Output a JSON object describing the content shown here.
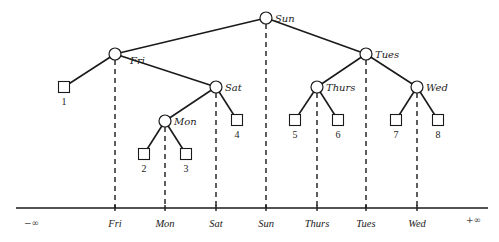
{
  "diagram": {
    "type": "binary-search-tree-with-axis",
    "nodes": [
      {
        "id": "sun",
        "label": "Sun",
        "x": 266,
        "y": 18
      },
      {
        "id": "fri",
        "label": "Fri",
        "x": 115,
        "y": 54
      },
      {
        "id": "tues",
        "label": "Tues",
        "x": 366,
        "y": 54
      },
      {
        "id": "sat",
        "label": "Sat",
        "x": 216,
        "y": 87
      },
      {
        "id": "thurs",
        "label": "Thurs",
        "x": 317,
        "y": 87
      },
      {
        "id": "wed",
        "label": "Wed",
        "x": 417,
        "y": 87
      },
      {
        "id": "mon",
        "label": "Mon",
        "x": 165,
        "y": 121
      }
    ],
    "leaves": [
      {
        "id": "leaf1",
        "label": "1",
        "parent": "fri",
        "x": 64,
        "y": 87
      },
      {
        "id": "leaf2",
        "label": "2",
        "parent": "mon",
        "x": 144,
        "y": 154
      },
      {
        "id": "leaf3",
        "label": "3",
        "parent": "mon",
        "x": 186,
        "y": 154
      },
      {
        "id": "leaf4",
        "label": "4",
        "parent": "sat",
        "x": 237,
        "y": 120
      },
      {
        "id": "leaf5",
        "label": "5",
        "parent": "thurs",
        "x": 295,
        "y": 120
      },
      {
        "id": "leaf6",
        "label": "6",
        "parent": "thurs",
        "x": 338,
        "y": 120
      },
      {
        "id": "leaf7",
        "label": "7",
        "parent": "wed",
        "x": 396,
        "y": 120
      },
      {
        "id": "leaf8",
        "label": "8",
        "parent": "wed",
        "x": 438,
        "y": 120
      }
    ],
    "edges": [
      [
        "sun",
        "fri"
      ],
      [
        "sun",
        "tues"
      ],
      [
        "fri",
        "leaf1"
      ],
      [
        "fri",
        "sat"
      ],
      [
        "sat",
        "mon"
      ],
      [
        "sat",
        "leaf4"
      ],
      [
        "mon",
        "leaf2"
      ],
      [
        "mon",
        "leaf3"
      ],
      [
        "tues",
        "thurs"
      ],
      [
        "tues",
        "wed"
      ],
      [
        "thurs",
        "leaf5"
      ],
      [
        "thurs",
        "leaf6"
      ],
      [
        "wed",
        "leaf7"
      ],
      [
        "wed",
        "leaf8"
      ]
    ],
    "axis": {
      "y": 208,
      "x_start": 16,
      "x_end": 488,
      "left_label": "−∞",
      "right_label": "+∞",
      "ticks": [
        {
          "label": "Fri",
          "x": 115
        },
        {
          "label": "Mon",
          "x": 165
        },
        {
          "label": "Sat",
          "x": 216
        },
        {
          "label": "Sun",
          "x": 266
        },
        {
          "label": "Thurs",
          "x": 317
        },
        {
          "label": "Tues",
          "x": 366
        },
        {
          "label": "Wed",
          "x": 417
        }
      ]
    }
  }
}
